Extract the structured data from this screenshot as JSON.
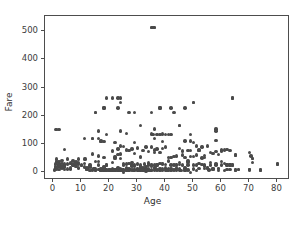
{
  "chart_data": {
    "type": "scatter",
    "title": "",
    "xlabel": "Age",
    "ylabel": "Fare",
    "xlim": [
      -3.0,
      84.5
    ],
    "ylim": [
      -27.0,
      553.0
    ],
    "xticks": [
      0,
      10,
      20,
      30,
      40,
      50,
      60,
      70,
      80
    ],
    "xticklabels": [
      "0",
      "10",
      "20",
      "30",
      "40",
      "50",
      "60",
      "70",
      "80"
    ],
    "yticks": [
      0,
      100,
      200,
      300,
      400,
      500
    ],
    "yticklabels": [
      "0",
      "100",
      "200",
      "300",
      "400",
      "500"
    ],
    "grid": false,
    "legend": null,
    "marker": {
      "shape": "circle",
      "color": "#4a4a4a",
      "size_px": 3.4
    },
    "axes_color": "#4d4d4d",
    "background": "#ffffff",
    "n_points": 352,
    "points": [
      [
        35.0,
        512.3
      ],
      [
        35.5,
        512.3
      ],
      [
        36.0,
        512.3
      ],
      [
        19.0,
        263.0
      ],
      [
        21.0,
        263.0
      ],
      [
        23.0,
        263.0
      ],
      [
        24.0,
        263.0
      ],
      [
        64.0,
        263.0
      ],
      [
        24.0,
        247.5
      ],
      [
        50.0,
        247.5
      ],
      [
        23.0,
        227.5
      ],
      [
        38.0,
        227.5
      ],
      [
        42.0,
        227.5
      ],
      [
        18.0,
        227.5
      ],
      [
        15.0,
        211.3
      ],
      [
        27.0,
        211.3
      ],
      [
        29.0,
        211.3
      ],
      [
        43.0,
        211.3
      ],
      [
        35.0,
        211.5
      ],
      [
        31.0,
        164.9
      ],
      [
        45.0,
        164.9
      ],
      [
        1.0,
        151.55
      ],
      [
        2.0,
        151.55
      ],
      [
        36.0,
        153.46
      ],
      [
        58.0,
        153.46
      ],
      [
        58.0,
        146.52
      ],
      [
        24.0,
        146.52
      ],
      [
        16.0,
        146.52
      ],
      [
        26.0,
        136.78
      ],
      [
        35.0,
        135.63
      ],
      [
        39.0,
        135.63
      ],
      [
        42.0,
        134.5
      ],
      [
        38.0,
        133.65
      ],
      [
        35.5,
        135.0
      ],
      [
        37.0,
        134.5
      ],
      [
        40.0,
        134.5
      ],
      [
        19.0,
        134.5
      ],
      [
        49.0,
        133.0
      ],
      [
        11.0,
        120.0
      ],
      [
        14.0,
        120.0
      ],
      [
        16.0,
        120.0
      ],
      [
        58.0,
        113.275
      ],
      [
        47.0,
        110.88
      ],
      [
        36.0,
        120.0
      ],
      [
        49.0,
        110.88
      ],
      [
        22.0,
        106.425
      ],
      [
        29.0,
        106.425
      ],
      [
        4.0,
        81.8583
      ],
      [
        17.0,
        108.9
      ],
      [
        24.0,
        93.5
      ],
      [
        35.0,
        90.0
      ],
      [
        39.0,
        83.475
      ],
      [
        45.0,
        83.475
      ],
      [
        50.0,
        106.425
      ],
      [
        51.0,
        93.5
      ],
      [
        53.0,
        89.1042
      ],
      [
        55.0,
        93.5
      ],
      [
        60.0,
        79.2
      ],
      [
        61.0,
        79.2
      ],
      [
        62.0,
        80.0
      ],
      [
        63.0,
        77.9583
      ],
      [
        65.0,
        61.9792
      ],
      [
        70.0,
        71.0
      ],
      [
        70.5,
        57.75
      ],
      [
        71.0,
        49.5042
      ],
      [
        74.0,
        7.775
      ],
      [
        80.0,
        30.0
      ],
      [
        18.0,
        108.9
      ],
      [
        23.0,
        82.1708
      ],
      [
        25.0,
        91.0792
      ],
      [
        27.0,
        76.7292
      ],
      [
        28.0,
        82.1708
      ],
      [
        30.0,
        86.5
      ],
      [
        31.0,
        52.0
      ],
      [
        32.0,
        76.2917
      ],
      [
        33.0,
        90.0
      ],
      [
        34.0,
        73.5
      ],
      [
        36.0,
        78.85
      ],
      [
        37.0,
        83.1583
      ],
      [
        38.0,
        71.2833
      ],
      [
        40.0,
        90.0
      ],
      [
        41.0,
        51.8625
      ],
      [
        43.0,
        55.4417
      ],
      [
        44.0,
        57.9792
      ],
      [
        46.0,
        75.2417
      ],
      [
        48.0,
        76.7292
      ],
      [
        52.0,
        78.2667
      ],
      [
        54.0,
        59.4
      ],
      [
        56.0,
        69.55
      ],
      [
        57.0,
        66.6
      ],
      [
        58.0,
        73.5
      ],
      [
        59.0,
        63.3583
      ],
      [
        2.0,
        39.0
      ],
      [
        3.0,
        41.5792
      ],
      [
        5.0,
        46.9
      ],
      [
        6.0,
        33.0
      ],
      [
        7.0,
        39.6875
      ],
      [
        8.0,
        36.75
      ],
      [
        9.0,
        31.3875
      ],
      [
        10.0,
        27.9
      ],
      [
        11.5,
        46.9
      ],
      [
        12.0,
        11.2417
      ],
      [
        13.0,
        19.5
      ],
      [
        14.5,
        14.4542
      ],
      [
        15.0,
        8.0292
      ],
      [
        16.0,
        57.9792
      ],
      [
        17.0,
        7.925
      ],
      [
        18.0,
        53.1
      ],
      [
        19.0,
        26.0
      ],
      [
        20.0,
        7.8542
      ],
      [
        21.0,
        77.2875
      ],
      [
        22.0,
        49.5
      ],
      [
        23.0,
        63.3583
      ],
      [
        24.0,
        65.0
      ],
      [
        25.0,
        7.775
      ],
      [
        26.0,
        30.0
      ],
      [
        27.0,
        30.5
      ],
      [
        28.0,
        35.5
      ],
      [
        29.0,
        66.6
      ],
      [
        30.0,
        27.75
      ],
      [
        31.0,
        57.0
      ],
      [
        32.0,
        7.8958
      ],
      [
        33.0,
        20.525
      ],
      [
        34.0,
        32.5
      ],
      [
        35.0,
        26.2875
      ],
      [
        36.0,
        26.2875
      ],
      [
        37.0,
        26.0
      ],
      [
        38.0,
        227.525
      ],
      [
        39.0,
        29.125
      ],
      [
        40.0,
        27.7208
      ],
      [
        41.0,
        39.6875
      ],
      [
        42.0,
        52.5542
      ],
      [
        43.0,
        26.55
      ],
      [
        44.0,
        27.7208
      ],
      [
        45.0,
        35.5
      ],
      [
        46.0,
        61.175
      ],
      [
        47.0,
        52.5542
      ],
      [
        48.0,
        39.6
      ],
      [
        49.0,
        56.9292
      ],
      [
        50.0,
        55.9
      ],
      [
        51.0,
        61.3792
      ],
      [
        52.0,
        30.5
      ],
      [
        53.0,
        51.4792
      ],
      [
        54.0,
        51.8625
      ],
      [
        55.0,
        16.0
      ],
      [
        56.0,
        35.5
      ],
      [
        57.0,
        13.0
      ],
      [
        58.0,
        26.55
      ],
      [
        59.0,
        13.5
      ],
      [
        60.0,
        26.55
      ],
      [
        61.0,
        32.3208
      ],
      [
        62.0,
        26.55
      ],
      [
        63.0,
        26.0
      ],
      [
        64.0,
        26.0
      ],
      [
        65.0,
        7.75
      ],
      [
        66.0,
        10.5
      ],
      [
        70.0,
        10.5
      ],
      [
        71.0,
        34.6542
      ],
      [
        0.42,
        8.5167
      ],
      [
        0.67,
        14.5
      ],
      [
        0.75,
        19.2583
      ],
      [
        0.83,
        29.0
      ],
      [
        0.92,
        151.55
      ],
      [
        1.0,
        11.1333
      ],
      [
        1.0,
        46.9
      ],
      [
        1.0,
        39.0
      ],
      [
        2.0,
        21.075
      ],
      [
        2.0,
        29.125
      ],
      [
        2.0,
        26.0
      ],
      [
        2.0,
        23.45
      ],
      [
        3.0,
        21.075
      ],
      [
        3.0,
        15.9
      ],
      [
        4.0,
        16.7
      ],
      [
        4.0,
        22.025
      ],
      [
        4.0,
        29.125
      ],
      [
        5.0,
        27.75
      ],
      [
        5.0,
        31.3875
      ],
      [
        6.0,
        12.475
      ],
      [
        6.0,
        31.275
      ],
      [
        7.0,
        26.25
      ],
      [
        8.0,
        21.075
      ],
      [
        8.0,
        29.0
      ],
      [
        9.0,
        15.9
      ],
      [
        9.0,
        27.9
      ],
      [
        10.0,
        24.15
      ],
      [
        11.0,
        31.275
      ],
      [
        12.0,
        15.75
      ],
      [
        13.0,
        26.25
      ],
      [
        14.0,
        7.8542
      ],
      [
        14.0,
        11.2417
      ],
      [
        14.0,
        65.0
      ],
      [
        15.0,
        14.4542
      ],
      [
        15.0,
        7.2292
      ],
      [
        15.0,
        39.0
      ],
      [
        16.0,
        9.2167
      ],
      [
        16.0,
        26.0
      ],
      [
        16.0,
        10.5
      ],
      [
        17.0,
        8.6625
      ],
      [
        17.0,
        7.925
      ],
      [
        17.0,
        110.8833
      ],
      [
        18.0,
        7.4958
      ],
      [
        18.0,
        13.0
      ],
      [
        18.0,
        20.2125
      ],
      [
        18.0,
        7.775
      ],
      [
        18.0,
        9.8417
      ],
      [
        19.0,
        7.8958
      ],
      [
        19.0,
        10.5
      ],
      [
        19.0,
        26.0
      ],
      [
        19.0,
        8.05
      ],
      [
        20.0,
        9.8458
      ],
      [
        20.0,
        7.925
      ],
      [
        20.0,
        8.05
      ],
      [
        20.0,
        7.8542
      ],
      [
        21.0,
        8.05
      ],
      [
        21.0,
        7.925
      ],
      [
        21.0,
        73.5
      ],
      [
        21.0,
        34.375
      ],
      [
        22.0,
        7.25
      ],
      [
        22.0,
        10.5
      ],
      [
        22.0,
        55.0
      ],
      [
        22.0,
        7.775
      ],
      [
        23.0,
        13.0
      ],
      [
        23.0,
        7.8542
      ],
      [
        23.0,
        15.0458
      ],
      [
        24.0,
        7.4958
      ],
      [
        24.0,
        13.0
      ],
      [
        24.0,
        49.5042
      ],
      [
        24.0,
        7.7958
      ],
      [
        25.0,
        7.65
      ],
      [
        25.0,
        26.0
      ],
      [
        25.0,
        7.925
      ],
      [
        26.0,
        7.8542
      ],
      [
        26.0,
        8.05
      ],
      [
        26.0,
        14.4542
      ],
      [
        26.0,
        78.85
      ],
      [
        27.0,
        7.925
      ],
      [
        27.0,
        10.5
      ],
      [
        27.0,
        13.8583
      ],
      [
        28.0,
        7.8958
      ],
      [
        28.0,
        24.15
      ],
      [
        28.0,
        26.55
      ],
      [
        29.0,
        7.875
      ],
      [
        29.0,
        10.5
      ],
      [
        29.0,
        21.0
      ],
      [
        30.0,
        7.8958
      ],
      [
        30.0,
        13.0
      ],
      [
        30.0,
        12.475
      ],
      [
        30.0,
        31.0
      ],
      [
        31.0,
        18.0
      ],
      [
        31.0,
        7.925
      ],
      [
        31.0,
        26.25
      ],
      [
        32.0,
        7.925
      ],
      [
        32.0,
        8.3625
      ],
      [
        32.0,
        15.5
      ],
      [
        33.0,
        7.8958
      ],
      [
        33.0,
        12.275
      ],
      [
        34.0,
        13.0
      ],
      [
        34.0,
        26.0
      ],
      [
        34.0,
        8.05
      ],
      [
        35.0,
        7.125
      ],
      [
        35.0,
        26.0
      ],
      [
        35.0,
        21.0
      ],
      [
        36.0,
        7.8958
      ],
      [
        36.0,
        17.4
      ],
      [
        36.0,
        15.55
      ],
      [
        36.0,
        71.0
      ],
      [
        37.0,
        7.925
      ],
      [
        37.0,
        26.0
      ],
      [
        38.0,
        7.05
      ],
      [
        38.0,
        13.0
      ],
      [
        38.0,
        31.3875
      ],
      [
        39.0,
        7.925
      ],
      [
        39.0,
        13.0
      ],
      [
        39.0,
        31.275
      ],
      [
        40.0,
        7.225
      ],
      [
        40.0,
        9.475
      ],
      [
        40.0,
        15.75
      ],
      [
        41.0,
        7.125
      ],
      [
        41.0,
        14.1083
      ],
      [
        42.0,
        7.55
      ],
      [
        42.0,
        13.0
      ],
      [
        42.0,
        26.0
      ],
      [
        43.0,
        8.05
      ],
      [
        44.0,
        7.925
      ],
      [
        44.0,
        16.1
      ],
      [
        45.0,
        7.75
      ],
      [
        45.0,
        27.9
      ],
      [
        45.0,
        13.5
      ],
      [
        46.0,
        26.0
      ],
      [
        47.0,
        7.25
      ],
      [
        47.0,
        9.0
      ],
      [
        47.0,
        15.0
      ],
      [
        48.0,
        7.8542
      ],
      [
        48.0,
        25.9292
      ],
      [
        49.0,
        0.0
      ],
      [
        50.0,
        13.0
      ],
      [
        50.0,
        26.0
      ],
      [
        50.0,
        10.5
      ],
      [
        51.0,
        7.0542
      ],
      [
        51.0,
        26.55
      ],
      [
        52.0,
        13.5
      ],
      [
        53.0,
        27.4458
      ],
      [
        54.0,
        26.0
      ],
      [
        54.0,
        14.0
      ],
      [
        55.0,
        16.0
      ],
      [
        56.0,
        26.55
      ],
      [
        57.0,
        12.35
      ],
      [
        58.0,
        29.7
      ],
      [
        59.0,
        7.25
      ],
      [
        60.0,
        39.0
      ],
      [
        61.0,
        6.2375
      ],
      [
        62.0,
        9.6875
      ],
      [
        63.0,
        9.5875
      ],
      [
        64.0,
        26.0
      ],
      [
        65.0,
        7.75
      ],
      [
        66.0,
        10.5
      ],
      [
        70.0,
        10.5
      ],
      [
        70.0,
        7.75
      ],
      [
        74.0,
        7.775
      ],
      [
        2.0,
        10.4625
      ],
      [
        3.0,
        31.3875
      ],
      [
        9.0,
        46.9
      ],
      [
        10.0,
        24.15
      ],
      [
        11.0,
        46.9
      ],
      [
        1.0,
        37.0042
      ],
      [
        4.0,
        23.0
      ],
      [
        6.0,
        15.2458
      ],
      [
        7.0,
        26.25
      ],
      [
        8.0,
        27.9
      ],
      [
        13.0,
        7.2292
      ],
      [
        14.0,
        120.0
      ],
      [
        16.0,
        39.4
      ],
      [
        17.0,
        14.4583
      ],
      [
        18.0,
        227.525
      ],
      [
        19.0,
        6.75
      ],
      [
        20.0,
        7.05
      ],
      [
        21.0,
        11.5
      ],
      [
        22.0,
        9.35
      ],
      [
        23.0,
        7.55
      ],
      [
        24.0,
        7.7958
      ],
      [
        25.0,
        31.5
      ],
      [
        26.0,
        16.1
      ],
      [
        27.0,
        7.8958
      ],
      [
        28.0,
        22.525
      ],
      [
        29.0,
        7.875
      ],
      [
        30.0,
        8.6625
      ],
      [
        31.0,
        7.8542
      ],
      [
        32.0,
        7.8958
      ],
      [
        33.0,
        8.6542
      ],
      [
        34.5,
        6.4375
      ],
      [
        35.0,
        8.05
      ],
      [
        36.5,
        17.4
      ],
      [
        40.5,
        7.75
      ],
      [
        44.0,
        26.0
      ],
      [
        45.5,
        7.225
      ],
      [
        48.0,
        34.375
      ],
      [
        55.5,
        8.05
      ],
      [
        57.0,
        10.5
      ],
      [
        59.0,
        13.5
      ],
      [
        28.5,
        7.2292
      ],
      [
        30.5,
        7.75
      ],
      [
        32.5,
        30.0708
      ],
      [
        20.5,
        7.25
      ],
      [
        23.5,
        7.2292
      ],
      [
        24.5,
        8.05
      ],
      [
        14.5,
        14.4542
      ],
      [
        0.75,
        19.2583
      ],
      [
        1.0,
        15.7417
      ],
      [
        2.0,
        20.575
      ],
      [
        3.0,
        18.75
      ],
      [
        4.0,
        11.1333
      ],
      [
        5.0,
        12.475
      ],
      [
        9.0,
        34.375
      ],
      [
        11.0,
        18.7875
      ],
      [
        12.0,
        11.2417
      ],
      [
        15.0,
        211.3375
      ],
      [
        17.0,
        7.2292
      ],
      [
        18.0,
        18.0
      ],
      [
        19.0,
        7.65
      ],
      [
        21.0,
        7.7958
      ],
      [
        22.0,
        7.75
      ],
      [
        25.0,
        0.0
      ],
      [
        26.0,
        7.8542
      ],
      [
        27.0,
        11.1333
      ],
      [
        29.0,
        26.0
      ],
      [
        31.0,
        20.525
      ],
      [
        33.0,
        5.0
      ],
      [
        35.0,
        512.3292
      ],
      [
        36.0,
        512.3292
      ],
      [
        39.0,
        108.9
      ],
      [
        41.0,
        134.5
      ],
      [
        45.0,
        164.8667
      ],
      [
        47.0,
        227.525
      ],
      [
        49.0,
        76.7292
      ],
      [
        50.0,
        247.5208
      ],
      [
        52.0,
        79.65
      ],
      [
        54.0,
        23.0
      ],
      [
        60.0,
        75.25
      ],
      [
        62.0,
        26.55
      ],
      [
        63.0,
        26.0
      ],
      [
        64.0,
        263.0
      ],
      [
        65.0,
        61.9792
      ],
      [
        71.0,
        49.5042
      ],
      [
        80.0,
        30.0
      ]
    ]
  }
}
